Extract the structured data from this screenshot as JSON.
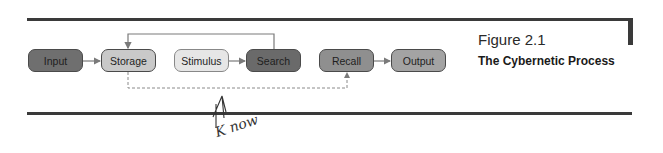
{
  "figure": {
    "number": "Figure 2.1",
    "title": "The Cybernetic Process"
  },
  "nodes": [
    {
      "id": "input",
      "label": "Input",
      "fill": "#6f6f6f"
    },
    {
      "id": "storage",
      "label": "Storage",
      "fill": "#c9c9c9"
    },
    {
      "id": "stimulus",
      "label": "Stimulus",
      "fill": "#e6e6e6"
    },
    {
      "id": "search",
      "label": "Search",
      "fill": "#6a6a6a"
    },
    {
      "id": "recall",
      "label": "Recall",
      "fill": "#8f8f8f"
    },
    {
      "id": "output",
      "label": "Output",
      "fill": "#a3a3a3"
    }
  ],
  "edges": [
    {
      "from": "Input",
      "to": "Storage",
      "style": "solid"
    },
    {
      "from": "Stimulus",
      "to": "Search",
      "style": "solid"
    },
    {
      "from": "Search",
      "to": "Storage",
      "style": "solid-feedback"
    },
    {
      "from": "Storage",
      "to": "Recall",
      "style": "dashed"
    },
    {
      "from": "Recall",
      "to": "Output",
      "style": "solid"
    }
  ],
  "annotation": {
    "handwritten_text": "K now"
  },
  "colors": {
    "rule": "#3a3a3a",
    "wire": "#7a7a7a"
  }
}
